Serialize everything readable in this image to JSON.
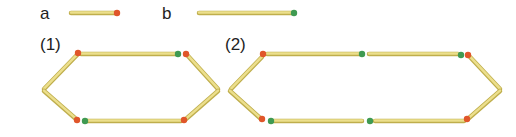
{
  "legend": [
    {
      "label": "a",
      "head_color": "#e0562a",
      "description": "short stick with orange head"
    },
    {
      "label": "b",
      "head_color": "#3f9a52",
      "description": "long stick with green head"
    }
  ],
  "figures": [
    {
      "label": "(1)"
    },
    {
      "label": "(2)"
    }
  ],
  "colors": {
    "stick": "#e6d77a",
    "stick_edge": "#bfae4c",
    "orange_head": "#e0562a",
    "green_head": "#3f9a52"
  }
}
